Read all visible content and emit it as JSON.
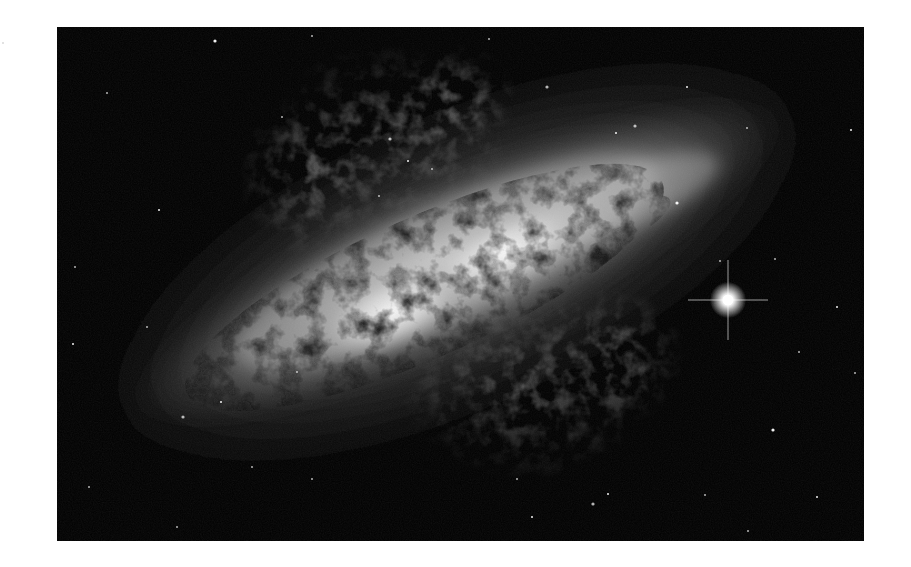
{
  "image": {
    "subject": "Cigar Galaxy (M82) — edge-on starburst galaxy, grayscale",
    "frame": {
      "x": 57,
      "y": 27,
      "width": 807,
      "height": 514
    },
    "colors": {
      "page_background": "#ffffff",
      "sky": "#000000",
      "core": "#f2f2f2",
      "disk_mid": "#9a9a9a",
      "halo": "#3a3a3a",
      "dust": "#1a1a1a",
      "filament": "#6e6e6e",
      "star": "#ffffff"
    },
    "disk": {
      "center": [
        400,
        235
      ],
      "rotation_deg": -24,
      "length": 760,
      "thickness": 170
    },
    "bright_star": {
      "position": [
        671,
        273
      ],
      "radius": 7,
      "spike_length": 40
    },
    "field_stars": [
      [
        158,
        14
      ],
      [
        255,
        9
      ],
      [
        432,
        12
      ],
      [
        102,
        183
      ],
      [
        50,
        66
      ],
      [
        333,
        112
      ],
      [
        351,
        134
      ],
      [
        322,
        169
      ],
      [
        375,
        142
      ],
      [
        559,
        106
      ],
      [
        578,
        99
      ],
      [
        690,
        101
      ],
      [
        794,
        103
      ],
      [
        742,
        325
      ],
      [
        798,
        346
      ],
      [
        716,
        403
      ],
      [
        691,
        504
      ],
      [
        90,
        300
      ],
      [
        16,
        317
      ],
      [
        240,
        345
      ],
      [
        126,
        390
      ],
      [
        164,
        375
      ],
      [
        255,
        452
      ],
      [
        195,
        440
      ],
      [
        475,
        490
      ],
      [
        536,
        477
      ],
      [
        460,
        452
      ],
      [
        551,
        467
      ],
      [
        648,
        468
      ],
      [
        718,
        232
      ],
      [
        620,
        176
      ],
      [
        663,
        234
      ],
      [
        18,
        240
      ],
      [
        780,
        280
      ],
      [
        225,
        90
      ],
      [
        490,
        60
      ],
      [
        630,
        60
      ],
      [
        32,
        460
      ],
      [
        120,
        500
      ],
      [
        760,
        470
      ]
    ]
  }
}
